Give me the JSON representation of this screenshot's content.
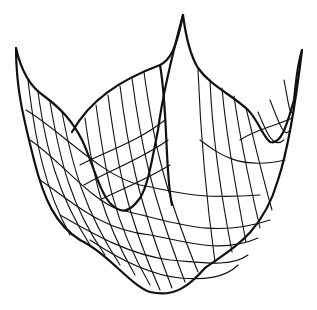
{
  "figure": {
    "colors": {
      "background": "#ffffff",
      "ink": "#111111"
    },
    "outline": [
      "M16 48 C22 75 32 88 44 96 C60 108 72 120 82 140 C92 160 100 195 112 205 C120 212 128 215 140 198 C148 186 152 160 158 130 C162 100 168 70 183 15",
      "M183 15 C186 38 190 55 198 68 C210 85 232 95 248 110 C258 120 262 135 270 142 C282 146 288 120 294 100 C296 85 296 70 302 50",
      "M16 48 C16 90 24 120 34 160 C44 200 56 225 80 240 C110 255 130 285 150 292 C175 298 190 285 205 268 C230 250 262 235 278 180 C288 150 296 100 302 50",
      "M72 132 C90 100 120 80 160 65 C170 60 176 50 183 15",
      "M160 65 C168 110 165 175 172 205"
    ],
    "gridlines": [
      "M28 80 C35 140 45 190 70 235",
      "M38 92 C46 150 58 195 90 245",
      "M50 102 C60 160 70 205 105 255",
      "M62 112 C72 165 84 210 120 265",
      "M85 118 C92 170 100 215 135 275",
      "M96 105 C104 165 112 220 150 285",
      "M108 95 C116 155 124 210 160 290",
      "M120 86 C128 150 138 200 172 288",
      "M132 78 C140 140 150 190 185 282",
      "M144 72 C152 130 160 180 198 272",
      "M198 70 C200 120 205 190 215 262",
      "M210 80 C212 130 220 190 232 252",
      "M222 88 C226 135 236 190 246 242",
      "M234 96 C240 140 250 185 260 228",
      "M246 108 C254 140 262 175 272 210",
      "M258 112 C266 130 272 150 284 140",
      "M270 100 C278 120 284 140 290 130",
      "M284 80 C288 100 290 120 294 110",
      "M26 110 C60 130 100 175 140 185 C170 190 190 200 260 195",
      "M30 140 C60 160 90 200 120 210 C170 220 210 240 270 220",
      "M40 180 C70 200 100 230 150 235 C180 240 220 255 258 238",
      "M60 215 C95 235 130 255 170 260 C200 262 230 268 248 255",
      "M90 240 C120 260 150 275 180 278 C205 280 225 278 238 265",
      "M80 165 C110 150 140 140 165 120",
      "M84 185 C110 170 140 160 168 140",
      "M100 200 C120 190 145 180 170 165",
      "M200 140 C220 155 240 170 285 160",
      "M240 140 C255 130 270 128 292 118"
    ]
  }
}
